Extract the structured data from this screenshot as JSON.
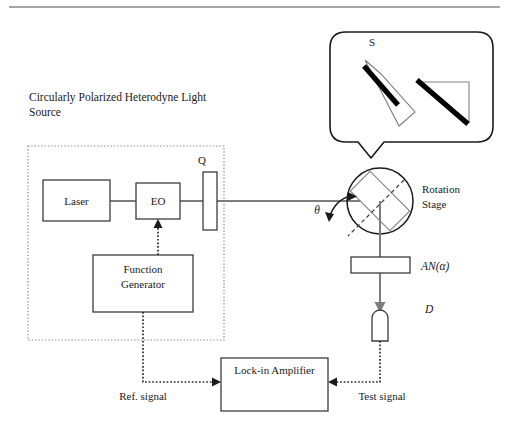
{
  "figure": {
    "title_text_line1": "Circularly   Polarized   Heterodyne   Light",
    "title_text_line2": "Source",
    "background_color": "#ffffff",
    "ink_color": "#1a1a1a",
    "beam_color": "#7d7d7d"
  },
  "components": {
    "laser": {
      "label": "Laser"
    },
    "eo_modulator": {
      "label": "EO"
    },
    "quarter_waveplate": {
      "label": "Q"
    },
    "function_generator": {
      "label_line1": "Function",
      "label_line2": "Generator"
    },
    "rotation_stage": {
      "label_line1": "Rotation",
      "label_line2": "Stage"
    },
    "analyzer": {
      "label": "AN(α)"
    },
    "detector": {
      "label": "D"
    },
    "lockin_amplifier": {
      "label": "Lock-in Amplifier"
    },
    "sample_callout": {
      "label": "S"
    }
  },
  "signals": {
    "reference": {
      "label": "Ref. signal"
    },
    "test": {
      "label": "Test signal"
    },
    "incidence_angle": {
      "label": "θ"
    }
  }
}
